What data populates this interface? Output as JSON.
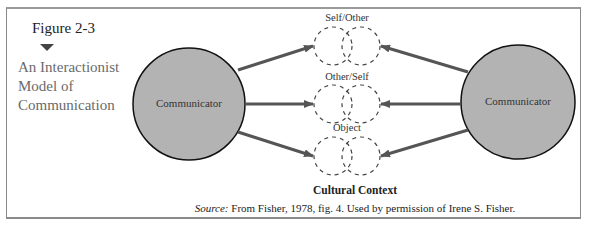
{
  "figure": {
    "number": "Figure 2-3",
    "title_lines": [
      "An Interactionist",
      "Model of",
      "Communication"
    ]
  },
  "diagram": {
    "nodes": {
      "left": {
        "label": "Communicator",
        "fill": "#b3b3b3"
      },
      "right": {
        "label": "Communicator",
        "fill": "#b3b3b3"
      }
    },
    "targets": [
      {
        "label": "Self/Other"
      },
      {
        "label": "Other/Self"
      },
      {
        "label": "Object"
      }
    ],
    "context_label": "Cultural Context",
    "arrow_color": "#555555"
  },
  "source": {
    "prefix": "Source:",
    "text": " From Fisher, 1978, fig. 4. Used by permission of Irene S. Fisher."
  }
}
